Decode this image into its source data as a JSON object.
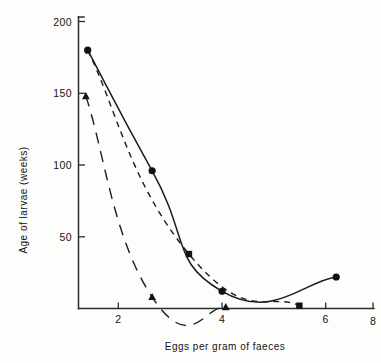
{
  "chart_data": {
    "type": "line",
    "title": "",
    "xlabel": "Eggs per gram of faeces",
    "ylabel": "Age of larvae (weeks)",
    "xlim": [
      0,
      8
    ],
    "ylim": [
      0,
      210
    ],
    "xticks": [
      2,
      4,
      6,
      8
    ],
    "yticks": [
      50,
      100,
      150,
      200
    ],
    "xtick_labels": [
      "2",
      "4",
      "6",
      "8"
    ],
    "ytick_labels": [
      "50",
      "100",
      "150",
      "200"
    ],
    "grid": false,
    "legend": "none",
    "series": [
      {
        "name": "solid-curve",
        "line_style": "solid",
        "marker": "circle",
        "color": "#1c1c1c",
        "x": [
          0.25,
          2.0,
          3.9,
          7.0
        ],
        "y": [
          180,
          96,
          12,
          22
        ],
        "points": [
          {
            "x": 0.25,
            "y": 180,
            "marker": "circle"
          },
          {
            "x": 2.0,
            "y": 96,
            "marker": "circle"
          },
          {
            "x": 3.9,
            "y": 12,
            "marker": "circle"
          },
          {
            "x": 7.0,
            "y": 22,
            "marker": "circle"
          }
        ]
      },
      {
        "name": "short-dashed-curve",
        "line_style": "dashed",
        "marker": "square",
        "color": "#1c1c1c",
        "x": [
          0.25,
          3.0,
          6.0
        ],
        "y": [
          180,
          38,
          2
        ],
        "points": [
          {
            "x": 3.0,
            "y": 38,
            "marker": "square"
          },
          {
            "x": 6.0,
            "y": 2,
            "marker": "square"
          }
        ]
      },
      {
        "name": "long-dashed-curve",
        "line_style": "long-dashed",
        "marker": "triangle",
        "color": "#1c1c1c",
        "x": [
          0.2,
          2.0,
          4.0
        ],
        "y": [
          148,
          8,
          1
        ],
        "points": [
          {
            "x": 0.2,
            "y": 148,
            "marker": "triangle"
          },
          {
            "x": 2.0,
            "y": 8,
            "marker": "triangle"
          },
          {
            "x": 4.0,
            "y": 1,
            "marker": "triangle"
          }
        ]
      }
    ],
    "annotations": []
  }
}
